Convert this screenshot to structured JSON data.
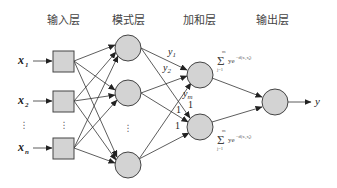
{
  "layers": {
    "input": "输入层",
    "pattern": "模式层",
    "summation": "加和层",
    "output": "输出层"
  },
  "inputs": [
    {
      "var": "x",
      "sub": "1"
    },
    {
      "var": "x",
      "sub": "2"
    },
    {
      "var": "x",
      "sub": "n"
    }
  ],
  "ellipsis": "⋮",
  "edge_labels": {
    "y1": {
      "var": "y",
      "sub": "1"
    },
    "y2": {
      "var": "y",
      "sub": "2"
    },
    "ym": {
      "var": "y",
      "sub": "m"
    },
    "one_a": "1",
    "one_b": "1"
  },
  "formulas": {
    "upper": {
      "sigma": "Σ",
      "top": "m",
      "bottom": "j=1",
      "body": "ye",
      "exp": "−d(xᵢ,xⱼ)"
    },
    "lower": {
      "sigma": "Σ",
      "top": "m",
      "bottom": "j=1",
      "body": "ye",
      "exp": "−d(xᵢ,xⱼ)"
    }
  },
  "output_label": "y",
  "colors": {
    "node_fill": "#d3d3d3",
    "node_stroke": "#444444",
    "edge": "#333333"
  }
}
